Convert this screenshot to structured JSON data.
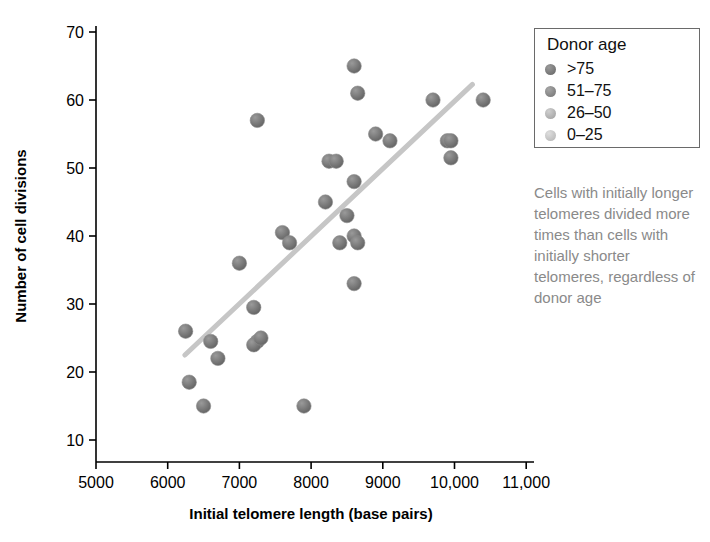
{
  "chart_data": {
    "type": "scatter",
    "title": "",
    "xlabel": "Initial telomere length (base pairs)",
    "ylabel": "Number of cell divisions",
    "xlim": [
      5000,
      11500
    ],
    "ylim": [
      8,
      72
    ],
    "xticks": [
      5000,
      6000,
      7000,
      8000,
      9000,
      10000,
      11000
    ],
    "xticklabels": [
      "5000",
      "6000",
      "7000",
      "8000",
      "9000",
      "10,000",
      "11,000"
    ],
    "yticks": [
      10,
      20,
      30,
      40,
      50,
      60,
      70
    ],
    "yticklabels": [
      "10",
      "20",
      "30",
      "40",
      "50",
      "60",
      "70"
    ],
    "grid": false,
    "legend_position": "top-right",
    "series": [
      {
        "name": ">75",
        "color": "#6e6e6e",
        "points": [
          {
            "x": 6250,
            "y": 26
          },
          {
            "x": 6500,
            "y": 15
          },
          {
            "x": 6700,
            "y": 22
          },
          {
            "x": 7250,
            "y": 24.5
          },
          {
            "x": 7900,
            "y": 15
          },
          {
            "x": 8200,
            "y": 45
          },
          {
            "x": 8400,
            "y": 39
          },
          {
            "x": 8600,
            "y": 33
          },
          {
            "x": 8600,
            "y": 48
          },
          {
            "x": 8900,
            "y": 55
          }
        ]
      },
      {
        "name": "51-75",
        "color": "#7c7c7c",
        "points": [
          {
            "x": 6600,
            "y": 24.5
          },
          {
            "x": 7200,
            "y": 24
          },
          {
            "x": 7600,
            "y": 40.5
          },
          {
            "x": 8250,
            "y": 51
          },
          {
            "x": 8600,
            "y": 40
          },
          {
            "x": 8650,
            "y": 61
          },
          {
            "x": 9100,
            "y": 54
          }
        ]
      },
      {
        "name": "26-50",
        "color": "#a8a8a8",
        "points": [
          {
            "x": 6300,
            "y": 18.5
          },
          {
            "x": 7000,
            "y": 36
          },
          {
            "x": 7200,
            "y": 29.5
          },
          {
            "x": 7300,
            "y": 25
          },
          {
            "x": 8350,
            "y": 51
          },
          {
            "x": 8500,
            "y": 43
          },
          {
            "x": 8650,
            "y": 39
          },
          {
            "x": 9700,
            "y": 60
          },
          {
            "x": 9900,
            "y": 54
          },
          {
            "x": 10400,
            "y": 60
          }
        ]
      },
      {
        "name": "0-25",
        "color": "#bdbdbd",
        "points": [
          {
            "x": 7250,
            "y": 57
          },
          {
            "x": 7700,
            "y": 39
          },
          {
            "x": 8600,
            "y": 65
          },
          {
            "x": 9950,
            "y": 54
          },
          {
            "x": 9950,
            "y": 51.5
          }
        ]
      }
    ],
    "trendline": {
      "name": "trend-line",
      "color": "#c6c6c6",
      "width": 5,
      "x_start": 6240,
      "y_start": 22.5,
      "x_end": 10250,
      "y_end": 62.3
    },
    "annotation": "Cells with initially longer telomeres divided more times than cells with initially shorter telomeres, regardless of donor age",
    "annotation_color": "#8a8a8a"
  },
  "legend": {
    "title": "Donor age",
    "items": [
      {
        "label": ">75",
        "color": "#6e6e6e"
      },
      {
        "label": "51–75",
        "color": "#7c7c7c"
      },
      {
        "label": "26–50",
        "color": "#a8a8a8"
      },
      {
        "label": "0–25",
        "color": "#bdbdbd"
      }
    ]
  }
}
